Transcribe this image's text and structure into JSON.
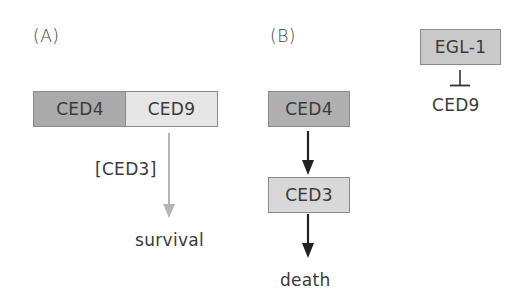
{
  "panels": {
    "a": {
      "label": "(A)",
      "complex": {
        "left": {
          "label": "CED4",
          "color": "#aaaaaa"
        },
        "right": {
          "label": "CED9",
          "color": "#e6e6e6"
        }
      },
      "arrow": {
        "label": "[CED3]",
        "color": "#b5b5b5",
        "style": "activation-arrow"
      },
      "outcome": "survival"
    },
    "b": {
      "label": "(B)",
      "pathway": [
        {
          "label": "CED4",
          "color": "#b0b0b0"
        },
        {
          "label": "CED3",
          "color": "#d8d8d8"
        }
      ],
      "arrow_color": "#222222",
      "outcome": "death",
      "inhibition": {
        "inhibitor": {
          "label": "EGL-1",
          "color": "#c9c9c9"
        },
        "target": "CED9",
        "symbol": "inhibition-bar"
      }
    }
  }
}
